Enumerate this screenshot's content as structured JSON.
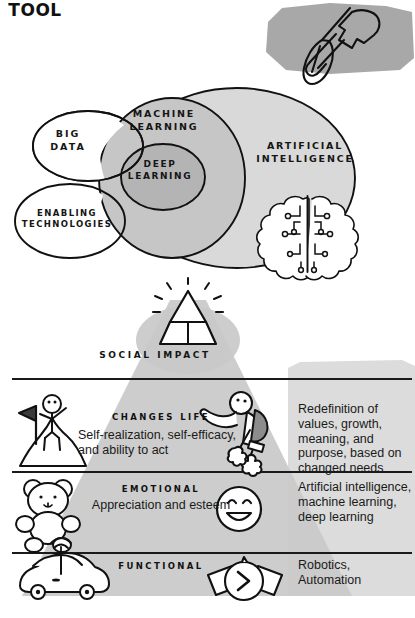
{
  "tool_badge": {
    "label": "Tool",
    "icon": "hammer-screwdriver-icon",
    "fill": "#a8a8a8"
  },
  "venn": {
    "title_ai": "ARTIFICIAL\nINTELLIGENCE",
    "ai_label_line1": "ARTIFICIAL",
    "ai_label_line2": "INTELLIGENCE",
    "ml_label_line1": "MACHINE",
    "ml_label_line2": "LEARNING",
    "dl_label_line1": "DEEP",
    "dl_label_line2": "LEARNING",
    "bigdata_line1": "BIG",
    "bigdata_line2": "DATA",
    "enabling_line1": "ENABLING",
    "enabling_line2": "TECHNOLOGIES",
    "brain_icon": "brain-circuit-icon",
    "colors": {
      "ai_fill": "#d9d9d9",
      "ml_fill": "#c6c6c6",
      "dl_fill": "#b4b4b4",
      "white_fill": "#ffffff",
      "stroke": "#111111"
    }
  },
  "pyramid": {
    "apex_label": "SOCIAL IMPACT",
    "apex_icon": "shining-pyramid-icon",
    "cone_fill": "#c9c9c9"
  },
  "rows": [
    {
      "title": "CHANGES LIFE",
      "subtitle": "Self-realization, self-efficacy, and ability to act",
      "right_text": "Redefinition of values, growth, meaning, and purpose, based on changed needs",
      "left_icon": "person-on-mountain-with-flag-icon",
      "mid_icon": "jetpack-flying-person-icon"
    },
    {
      "title": "EMOTIONAL",
      "subtitle": "Appreciation and esteem",
      "right_text": "Artificial intelligence, machine learning, deep learning",
      "left_icon": "teddy-bear-icon",
      "mid_icon": "smiling-face-icon"
    },
    {
      "title": "FUNCTIONAL",
      "subtitle": "",
      "right_text": "Robotics, Automation",
      "left_icon": "connected-car-icon",
      "mid_icon": "smartwatch-icon"
    }
  ],
  "right_panel": {
    "fill": "#dcdcdc"
  },
  "divider_color": "#1a1a1a"
}
